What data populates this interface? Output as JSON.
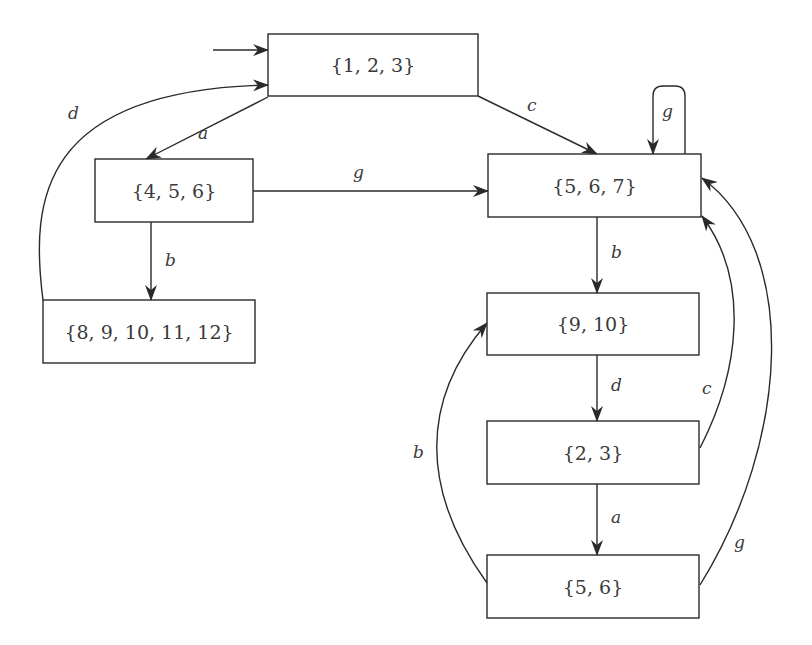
{
  "diagram": {
    "type": "state-transition-automaton",
    "nodes": [
      {
        "id": "n123",
        "label": "{1, 2, 3}",
        "x": 268,
        "y": 34,
        "w": 210,
        "h": 62,
        "initial": true
      },
      {
        "id": "n456",
        "label": "{4, 5, 6}",
        "x": 95,
        "y": 159,
        "w": 158,
        "h": 63
      },
      {
        "id": "n567",
        "label": "{5, 6, 7}",
        "x": 488,
        "y": 154,
        "w": 213,
        "h": 63
      },
      {
        "id": "n89101112",
        "label": "{8, 9, 10, 11, 12}",
        "x": 43,
        "y": 300,
        "w": 212,
        "h": 63
      },
      {
        "id": "n910",
        "label": "{9, 10}",
        "x": 487,
        "y": 293,
        "w": 212,
        "h": 62
      },
      {
        "id": "n23",
        "label": "{2, 3}",
        "x": 487,
        "y": 421,
        "w": 212,
        "h": 63
      },
      {
        "id": "n56",
        "label": "{5, 6}",
        "x": 487,
        "y": 555,
        "w": 212,
        "h": 63
      }
    ],
    "edges": [
      {
        "id": "e-start",
        "from": "start",
        "to": "n123",
        "label": "",
        "path": "M 213 50 L 268 50",
        "lx": 0,
        "ly": 0
      },
      {
        "id": "e-123-456-a",
        "from": "n123",
        "to": "n456",
        "label": "a",
        "path": "M 268 97 L 146 159",
        "lx": 198,
        "ly": 139
      },
      {
        "id": "e-123-567-c",
        "from": "n123",
        "to": "n567",
        "label": "c",
        "path": "M 478 96 L 597 154",
        "lx": 527,
        "ly": 111
      },
      {
        "id": "e-456-567-g",
        "from": "n456",
        "to": "n567",
        "label": "g",
        "path": "M 253 191 L 488 191",
        "lx": 353,
        "ly": 178
      },
      {
        "id": "e-456-89101112-b",
        "from": "n456",
        "to": "n89101112",
        "label": "b",
        "path": "M 151 222 L 151 300",
        "lx": 165,
        "ly": 266
      },
      {
        "id": "e-89101112-123-d",
        "from": "n89101112",
        "to": "n123",
        "label": "d",
        "path": "M 43 300 C 30 200, 40 90, 268 85",
        "lx": 68,
        "ly": 119
      },
      {
        "id": "e-567-567-g",
        "from": "n567",
        "to": "n567",
        "label": "g",
        "path": "M 685 154 L 685 96 Q 685 86 675 86 L 663 86 Q 653 86 653 96 L 653 154",
        "lx": 662,
        "ly": 117
      },
      {
        "id": "e-567-910-b",
        "from": "n567",
        "to": "n910",
        "label": "b",
        "path": "M 597 217 L 597 293",
        "lx": 611,
        "ly": 258
      },
      {
        "id": "e-910-23-d",
        "from": "n910",
        "to": "n23",
        "label": "d",
        "path": "M 597 355 L 597 421",
        "lx": 611,
        "ly": 391
      },
      {
        "id": "e-23-56-a",
        "from": "n23",
        "to": "n56",
        "label": "a",
        "path": "M 597 484 L 597 555",
        "lx": 611,
        "ly": 523
      },
      {
        "id": "e-23-567-c",
        "from": "n23",
        "to": "n567",
        "label": "c",
        "path": "M 700 448 C 740 370, 750 280, 702 216",
        "lx": 702,
        "ly": 394
      },
      {
        "id": "e-56-567-g",
        "from": "n56",
        "to": "n567",
        "label": "g",
        "path": "M 700 585 C 790 440, 800 250, 702 178",
        "lx": 734,
        "ly": 548
      },
      {
        "id": "e-56-910-b",
        "from": "n56",
        "to": "n910",
        "label": "b",
        "path": "M 487 583 C 420 490, 420 400, 487 323",
        "lx": 413,
        "ly": 458
      }
    ]
  },
  "colors": {
    "stroke": "#2a2a2a",
    "text": "#3a3a3a",
    "background": "#ffffff"
  }
}
